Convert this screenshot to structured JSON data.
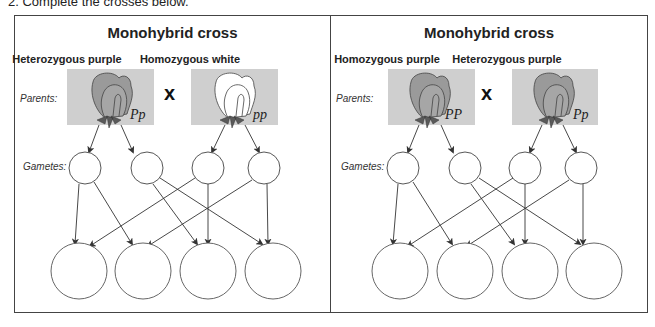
{
  "instruction": "2.  Complete the crosses below.",
  "panels": [
    {
      "title": "Monohybrid cross",
      "row_labels": {
        "parents": "Parents:",
        "gametes": "Gametes:"
      },
      "cross_symbol": "x",
      "parents": [
        {
          "label": "Heterozygous purple",
          "genotype": "Pp",
          "flower_color": "purple"
        },
        {
          "label": "Homozygous white",
          "genotype": "pp",
          "flower_color": "white"
        }
      ],
      "gametes": [
        "",
        "",
        "",
        ""
      ],
      "offspring": [
        "",
        "",
        "",
        ""
      ]
    },
    {
      "title": "Monohybrid cross",
      "row_labels": {
        "parents": "Parents:",
        "gametes": "Gametes:"
      },
      "cross_symbol": "x",
      "parents": [
        {
          "label": "Homozygous purple",
          "genotype": "PP",
          "flower_color": "purple"
        },
        {
          "label": "Heterozygous purple",
          "genotype": "Pp",
          "flower_color": "purple"
        }
      ],
      "gametes": [
        "",
        "",
        "",
        ""
      ],
      "offspring": [
        "",
        "",
        "",
        ""
      ]
    }
  ],
  "colors": {
    "box_bg": "#cfcfcf",
    "purple_petal": "#9a9a9a",
    "white_petal": "#ffffff",
    "sepal": "#5a5a5a",
    "line": "#333333"
  }
}
